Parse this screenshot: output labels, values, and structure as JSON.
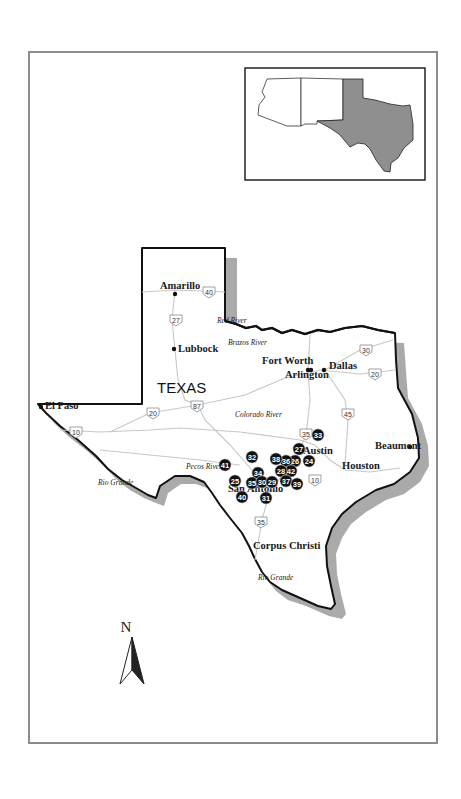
{
  "map": {
    "state_label": "TEXAS",
    "north_label": "N",
    "colors": {
      "frame": "#8c8c8c",
      "border": "#111111",
      "inset_texas_fill": "#8f8f8f",
      "roads": "#c8c8c8",
      "site_marker": "#111111"
    },
    "cities": [
      {
        "name": "Amarillo",
        "x": 160,
        "y": 289
      },
      {
        "name": "Lubbock",
        "x": 178,
        "y": 352
      },
      {
        "name": "Fort Worth",
        "x": 262,
        "y": 364
      },
      {
        "name": "Arlington",
        "x": 285,
        "y": 378
      },
      {
        "name": "Dallas",
        "x": 329,
        "y": 369
      },
      {
        "name": "El Paso",
        "x": 45,
        "y": 409
      },
      {
        "name": "Austin",
        "x": 303,
        "y": 454
      },
      {
        "name": "Beaumont",
        "x": 375,
        "y": 449
      },
      {
        "name": "Houston",
        "x": 342,
        "y": 469
      },
      {
        "name": "San Antonio",
        "x": 228,
        "y": 492
      },
      {
        "name": "Corpus Christi",
        "x": 253,
        "y": 549
      }
    ],
    "rivers": [
      {
        "name": "Red River",
        "x": 217,
        "y": 323
      },
      {
        "name": "Brazos River",
        "x": 228,
        "y": 345
      },
      {
        "name": "Colorado River",
        "x": 235,
        "y": 417
      },
      {
        "name": "Pecos River",
        "x": 186,
        "y": 469
      },
      {
        "name": "Rio Grande",
        "x": 98,
        "y": 485
      },
      {
        "name": "Rio Grande",
        "x": 258,
        "y": 580
      }
    ],
    "highways": [
      {
        "label": "40",
        "x": 209,
        "y": 292
      },
      {
        "label": "27",
        "x": 176,
        "y": 320
      },
      {
        "label": "30",
        "x": 366,
        "y": 350
      },
      {
        "label": "20",
        "x": 375,
        "y": 374
      },
      {
        "label": "87",
        "x": 197,
        "y": 406
      },
      {
        "label": "20",
        "x": 153,
        "y": 413
      },
      {
        "label": "45",
        "x": 348,
        "y": 414
      },
      {
        "label": "10",
        "x": 76,
        "y": 432
      },
      {
        "label": "35",
        "x": 306,
        "y": 434
      },
      {
        "label": "10",
        "x": 315,
        "y": 480
      },
      {
        "label": "35",
        "x": 261,
        "y": 522
      }
    ],
    "sites": [
      {
        "label": "33",
        "x": 318,
        "y": 435
      },
      {
        "label": "27",
        "x": 299,
        "y": 449
      },
      {
        "label": "24",
        "x": 309,
        "y": 461
      },
      {
        "label": "26",
        "x": 295,
        "y": 461
      },
      {
        "label": "36",
        "x": 286,
        "y": 461
      },
      {
        "label": "38",
        "x": 276,
        "y": 459
      },
      {
        "label": "32",
        "x": 252,
        "y": 457
      },
      {
        "label": "41",
        "x": 225,
        "y": 465
      },
      {
        "label": "42",
        "x": 291,
        "y": 471
      },
      {
        "label": "28",
        "x": 281,
        "y": 471
      },
      {
        "label": "34",
        "x": 258,
        "y": 473
      },
      {
        "label": "25",
        "x": 235,
        "y": 481
      },
      {
        "label": "35",
        "x": 252,
        "y": 483
      },
      {
        "label": "30",
        "x": 262,
        "y": 482
      },
      {
        "label": "29",
        "x": 272,
        "y": 482
      },
      {
        "label": "37",
        "x": 286,
        "y": 481
      },
      {
        "label": "39",
        "x": 297,
        "y": 484
      },
      {
        "label": "40",
        "x": 242,
        "y": 497
      },
      {
        "label": "31",
        "x": 266,
        "y": 498
      }
    ]
  }
}
